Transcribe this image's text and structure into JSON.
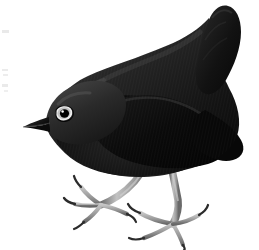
{
  "image": {
    "domain": "Natural-Image",
    "subject": "bird",
    "caption": "Dark plumaged perching bird with cocked tail, standing in profile facing left",
    "medium": "scanned engraving / halftone illustration",
    "background_color": "#ffffff",
    "width": 259,
    "height": 250
  },
  "palette": {
    "background": "#ffffff",
    "plumage_darkest": "#0d0d0d",
    "plumage_dark": "#1c1c1c",
    "plumage_mid": "#2e2e2e",
    "plumage_light": "#4a4a4a",
    "plumage_highlight": "#6b6b6b",
    "wing_shadow": "#080808",
    "beak": "#141414",
    "eye_ring": "#f2f2f2",
    "eye_pupil": "#000000",
    "eye_glint": "#ffffff",
    "leg_light": "#b9b9b9",
    "leg_mid": "#8e8e8e",
    "leg_shadow": "#5e5e5e",
    "claw": "#2b2b2b",
    "scan_artifact": "#d8d8d8"
  },
  "parts": [
    {
      "id": "tail",
      "label": "Tail",
      "note": "raised and cocked upward at right"
    },
    {
      "id": "back",
      "label": "Back / mantle",
      "note": "sloping dark line from nape to rump"
    },
    {
      "id": "wing",
      "label": "Folded wing",
      "note": "darkest region, central body"
    },
    {
      "id": "head",
      "label": "Head",
      "note": "rounded, facing left"
    },
    {
      "id": "beak",
      "label": "Beak",
      "note": "slender pointed wedge angled down-left"
    },
    {
      "id": "eye",
      "label": "Eye",
      "note": "dark pupil inside pale eye-ring"
    },
    {
      "id": "breast",
      "label": "Breast / belly",
      "note": "smooth curved underside"
    },
    {
      "id": "leg-front",
      "label": "Front leg",
      "note": "pale grey tarsus, left of frame"
    },
    {
      "id": "leg-rear",
      "label": "Rear leg",
      "note": "pale grey tarsus, right of frame"
    },
    {
      "id": "foot-front",
      "label": "Front foot",
      "note": "spread toes with dark curved claws"
    },
    {
      "id": "foot-rear",
      "label": "Rear foot",
      "note": "spread toes with dark curved claws"
    }
  ],
  "artifacts": {
    "label": "Scan edge marks",
    "note": "faint light grey specks along the left margin"
  }
}
